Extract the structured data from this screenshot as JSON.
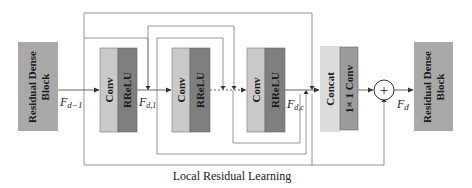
{
  "diagram": {
    "caption": "Local Residual Learning",
    "blocks": {
      "rdb_in": {
        "label_line1": "Residual Dense",
        "label_line2": "Block"
      },
      "conv1": {
        "conv": "Conv",
        "act": "RReLU"
      },
      "conv2": {
        "conv": "Conv",
        "act": "RReLU"
      },
      "conv3": {
        "conv": "Conv",
        "act": "RReLU"
      },
      "fusion": {
        "concat": "Concat",
        "conv1x1": "1× 1 Conv"
      },
      "rdb_out": {
        "label_line1": "Residual Dense",
        "label_line2": "Block"
      }
    },
    "signals": {
      "f_in_base": "F",
      "f_in_sub": "d−1",
      "f1_base": "F",
      "f1_sub": "d,1",
      "fc_base": "F",
      "fc_sub": "d,c",
      "fd_base": "F",
      "fd_sub": "d"
    },
    "add_symbol": "+",
    "colors": {
      "rdb_fill": "#a9a9a9",
      "conv_fill": "#c9c9c9",
      "act_fill": "#7f7f7f",
      "concat_fill": "#dcdcdc",
      "conv1x1_fill": "#9b9b9b",
      "line": "#7a7a7a",
      "text": "#1a1a1a"
    }
  }
}
